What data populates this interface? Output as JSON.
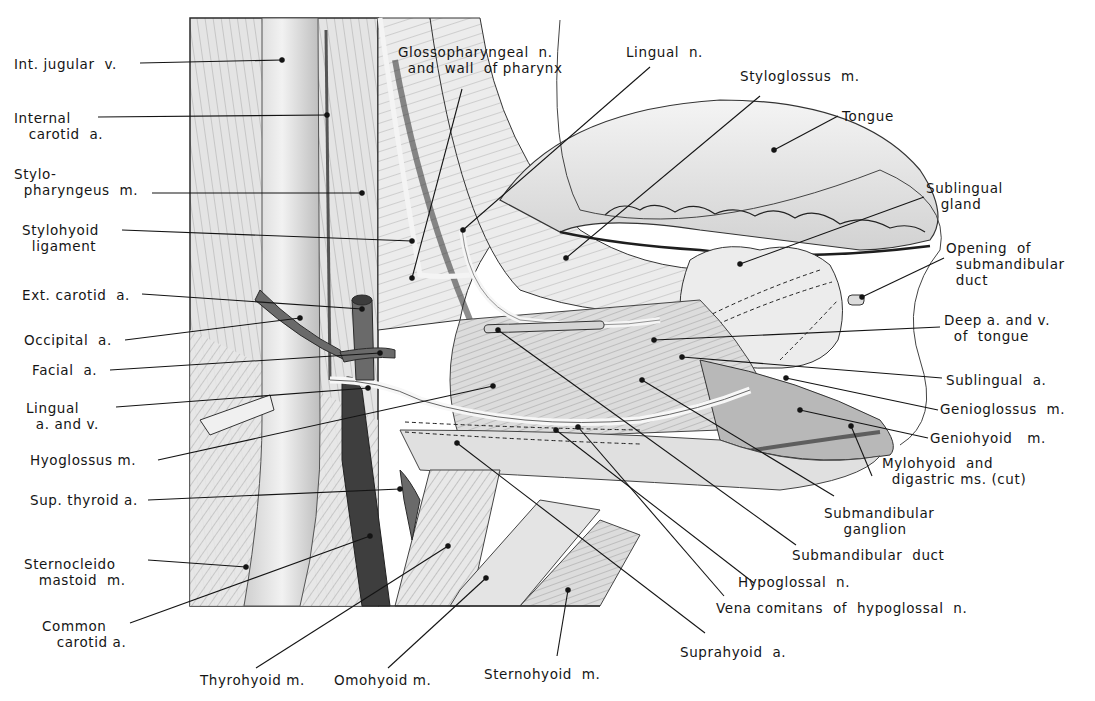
{
  "figure": {
    "colors": {
      "ink": "#151515",
      "muscle_light": "#e6e6e6",
      "muscle_mid": "#bdbdbd",
      "vessel_dark": "#4a4a4a",
      "paper": "#ffffff"
    }
  },
  "labels": {
    "left": [
      {
        "id": "int-jugular",
        "text": "Int. jugular  v.",
        "x": 14,
        "y": 56
      },
      {
        "id": "internal-carotid",
        "text": "Internal\n   carotid  a.",
        "x": 14,
        "y": 110
      },
      {
        "id": "stylopharyngeus",
        "text": "Stylo-\n  pharyngeus  m.",
        "x": 14,
        "y": 166
      },
      {
        "id": "stylohyoid-lig",
        "text": "Stylohyoid\n  ligament",
        "x": 22,
        "y": 222
      },
      {
        "id": "ext-carotid",
        "text": "Ext. carotid  a.",
        "x": 22,
        "y": 287
      },
      {
        "id": "occipital",
        "text": "Occipital  a.",
        "x": 24,
        "y": 332
      },
      {
        "id": "facial",
        "text": "Facial  a.",
        "x": 32,
        "y": 362
      },
      {
        "id": "lingual-av",
        "text": "Lingual\n  a. and v.",
        "x": 26,
        "y": 400
      },
      {
        "id": "hyoglossus",
        "text": "Hyoglossus m.",
        "x": 30,
        "y": 452
      },
      {
        "id": "sup-thyroid",
        "text": "Sup. thyroid a.",
        "x": 30,
        "y": 492
      },
      {
        "id": "sternocleido",
        "text": "Sternocleido\n   mastoid  m.",
        "x": 24,
        "y": 556
      },
      {
        "id": "common-carotid",
        "text": "Common\n   carotid a.",
        "x": 42,
        "y": 618
      }
    ],
    "top": [
      {
        "id": "glossopharyngeal",
        "text": "Glossopharyngeal  n.\n  and  wall  of pharynx",
        "x": 398,
        "y": 44
      },
      {
        "id": "lingual-n",
        "text": "Lingual  n.",
        "x": 626,
        "y": 44
      },
      {
        "id": "styloglossus",
        "text": "Styloglossus  m.",
        "x": 740,
        "y": 68
      },
      {
        "id": "tongue",
        "text": "Tongue",
        "x": 842,
        "y": 108
      }
    ],
    "right": [
      {
        "id": "sublingual-gland",
        "text": "Sublingual\n   gland",
        "x": 926,
        "y": 180
      },
      {
        "id": "opening-duct",
        "text": "Opening  of\n  submandibular\n  duct",
        "x": 946,
        "y": 240
      },
      {
        "id": "deep-av-tongue",
        "text": "Deep a. and v.\n  of  tongue",
        "x": 944,
        "y": 312
      },
      {
        "id": "sublingual-a",
        "text": "Sublingual  a.",
        "x": 946,
        "y": 372
      },
      {
        "id": "genioglossus",
        "text": "Genioglossus  m.",
        "x": 940,
        "y": 401
      },
      {
        "id": "geniohyoid",
        "text": "Geniohyoid   m.",
        "x": 930,
        "y": 430
      },
      {
        "id": "mylohyoid",
        "text": "Mylohyoid  and\n  digastric ms. (cut)",
        "x": 882,
        "y": 455
      },
      {
        "id": "submand-ganglion",
        "text": "Submandibular\n    ganglion",
        "x": 824,
        "y": 505
      },
      {
        "id": "submand-duct",
        "text": "Submandibular  duct",
        "x": 792,
        "y": 547
      }
    ],
    "bottom": [
      {
        "id": "hypoglossal",
        "text": "Hypoglossal  n.",
        "x": 738,
        "y": 574
      },
      {
        "id": "vena-comitans",
        "text": "Vena comitans  of  hypoglossal  n.",
        "x": 716,
        "y": 600
      },
      {
        "id": "suprahyoid",
        "text": "Suprahyoid  a.",
        "x": 680,
        "y": 644
      },
      {
        "id": "thyrohyoid",
        "text": "Thyrohyoid m.",
        "x": 200,
        "y": 672
      },
      {
        "id": "omohyoid",
        "text": "Omohyoid m.",
        "x": 334,
        "y": 672
      },
      {
        "id": "sternohyoid",
        "text": "Sternohyoid  m.",
        "x": 484,
        "y": 666
      }
    ]
  },
  "leaders": [
    {
      "for": "int-jugular",
      "x1": 140,
      "y1": 63,
      "x2": 282,
      "y2": 60
    },
    {
      "for": "internal-carotid",
      "x1": 98,
      "y1": 117,
      "x2": 327,
      "y2": 115
    },
    {
      "for": "stylopharyngeus",
      "x1": 152,
      "y1": 193,
      "x2": 362,
      "y2": 193
    },
    {
      "for": "stylohyoid-lig",
      "x1": 122,
      "y1": 230,
      "x2": 412,
      "y2": 241
    },
    {
      "for": "ext-carotid",
      "x1": 142,
      "y1": 294,
      "x2": 362,
      "y2": 309
    },
    {
      "for": "occipital",
      "x1": 125,
      "y1": 340,
      "x2": 300,
      "y2": 318
    },
    {
      "for": "facial",
      "x1": 110,
      "y1": 370,
      "x2": 380,
      "y2": 353
    },
    {
      "for": "lingual-av",
      "x1": 116,
      "y1": 407,
      "x2": 368,
      "y2": 388
    },
    {
      "for": "hyoglossus",
      "x1": 158,
      "y1": 460,
      "x2": 493,
      "y2": 386
    },
    {
      "for": "sup-thyroid",
      "x1": 148,
      "y1": 500,
      "x2": 400,
      "y2": 489
    },
    {
      "for": "sternocleido",
      "x1": 148,
      "y1": 560,
      "x2": 246,
      "y2": 567
    },
    {
      "for": "common-carotid",
      "x1": 130,
      "y1": 623,
      "x2": 370,
      "y2": 536
    },
    {
      "for": "glossopharyngeal",
      "x1": 462,
      "y1": 89,
      "x2": 412,
      "y2": 278
    },
    {
      "for": "lingual-n",
      "x1": 650,
      "y1": 67,
      "x2": 463,
      "y2": 230
    },
    {
      "for": "styloglossus",
      "x1": 760,
      "y1": 96,
      "x2": 566,
      "y2": 258
    },
    {
      "for": "tongue",
      "x1": 838,
      "y1": 116,
      "x2": 774,
      "y2": 150
    },
    {
      "for": "sublingual-gland",
      "x1": 924,
      "y1": 197,
      "x2": 740,
      "y2": 264
    },
    {
      "for": "opening-duct",
      "x1": 944,
      "y1": 258,
      "x2": 862,
      "y2": 297
    },
    {
      "for": "deep-av-tongue",
      "x1": 940,
      "y1": 327,
      "x2": 654,
      "y2": 340
    },
    {
      "for": "sublingual-a",
      "x1": 942,
      "y1": 378,
      "x2": 682,
      "y2": 357
    },
    {
      "for": "genioglossus",
      "x1": 938,
      "y1": 410,
      "x2": 786,
      "y2": 378
    },
    {
      "for": "geniohyoid",
      "x1": 928,
      "y1": 438,
      "x2": 800,
      "y2": 410
    },
    {
      "for": "mylohyoid",
      "x1": 872,
      "y1": 476,
      "x2": 851,
      "y2": 426
    },
    {
      "for": "submand-ganglion",
      "x1": 834,
      "y1": 496,
      "x2": 642,
      "y2": 380
    },
    {
      "for": "submand-duct",
      "x1": 796,
      "y1": 545,
      "x2": 498,
      "y2": 330
    },
    {
      "for": "hypoglossal",
      "x1": 754,
      "y1": 583,
      "x2": 556,
      "y2": 430
    },
    {
      "for": "vena-comitans",
      "x1": 724,
      "y1": 596,
      "x2": 578,
      "y2": 427
    },
    {
      "for": "suprahyoid",
      "x1": 705,
      "y1": 633,
      "x2": 457,
      "y2": 443
    },
    {
      "for": "thyrohyoid",
      "x1": 256,
      "y1": 668,
      "x2": 448,
      "y2": 546
    },
    {
      "for": "omohyoid",
      "x1": 388,
      "y1": 668,
      "x2": 486,
      "y2": 578
    },
    {
      "for": "sternohyoid",
      "x1": 557,
      "y1": 656,
      "x2": 568,
      "y2": 590
    }
  ]
}
